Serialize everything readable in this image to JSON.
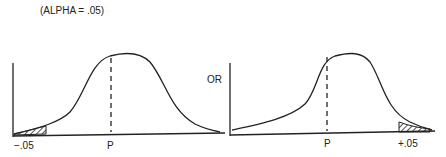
{
  "title": "(ALPHA = .05)",
  "connector": "OR",
  "left_panel": {
    "tail_label": "−.05",
    "center_label": "P",
    "tail_side": "left"
  },
  "right_panel": {
    "tail_label": "+.05",
    "center_label": "P",
    "tail_side": "right"
  },
  "colors": {
    "line": "#222222",
    "background": "#ffffff"
  }
}
